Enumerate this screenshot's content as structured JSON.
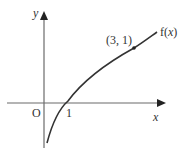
{
  "diagram": {
    "type": "function-graph",
    "axes": {
      "x_label": "x",
      "y_label": "y",
      "origin_label": "O",
      "x_tick_label": "1"
    },
    "curve": {
      "label_prefix": "f(",
      "label_var": "x",
      "label_suffix": ")",
      "point_label": "(3, 1)",
      "point": [
        3,
        1
      ],
      "x_intercept": 1,
      "color": "#333333"
    }
  }
}
